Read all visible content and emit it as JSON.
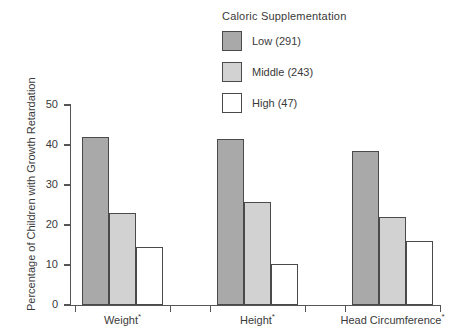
{
  "chart_data": {
    "type": "bar",
    "title": "",
    "legend_title": "Caloric Supplementation",
    "legend_position": "top-center",
    "categories": [
      "Weight*",
      "Height*",
      "Head Circumference*"
    ],
    "series": [
      {
        "name": "Low (291)",
        "short": "Low",
        "n": 291,
        "color": "#a9a9a9",
        "values": [
          42.0,
          41.5,
          38.5
        ]
      },
      {
        "name": "Middle (243)",
        "short": "Middle",
        "n": 243,
        "color": "#d2d2d2",
        "values": [
          23.0,
          25.7,
          22.0
        ]
      },
      {
        "name": "High (47)",
        "short": "High",
        "n": 47,
        "color": "#ffffff",
        "values": [
          14.5,
          10.3,
          16.0
        ]
      }
    ],
    "xlabel": "",
    "ylabel": "Percentage of Children with Growth Retardation",
    "ylim": [
      0,
      50
    ],
    "yticks": [
      0,
      10,
      20,
      30,
      40,
      50
    ],
    "ytick_labels": [
      "0",
      "10",
      "20",
      "30",
      "40",
      "50"
    ],
    "grid": false,
    "footnote_marker": "*"
  },
  "colors": {
    "axis": "#555555",
    "text": "#3a3a3a",
    "bar_border": "#4a4a4a",
    "background": "#ffffff"
  }
}
